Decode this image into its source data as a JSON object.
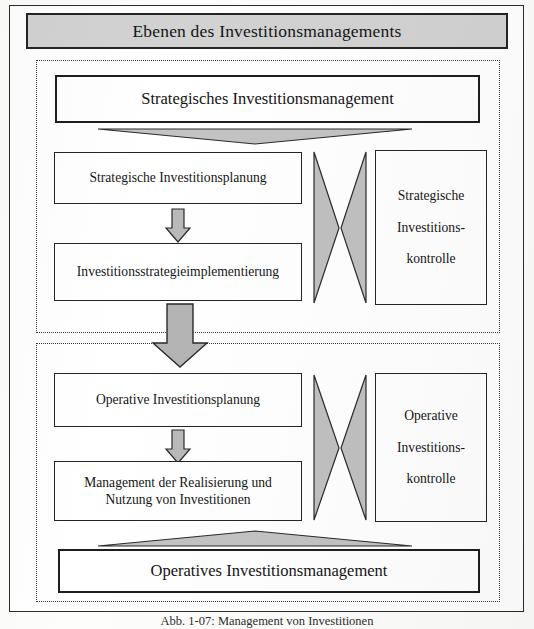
{
  "figure": {
    "title": "Ebenen des Investitionsmanagements",
    "caption": "Abb. 1-07:  Management von Investitionen"
  },
  "colors": {
    "banner_fill": "#d2d2d2",
    "arrow_fill": "#b9b9b9",
    "border_dark": "#1e1e1e",
    "page_background": "#ffffff"
  },
  "sections": {
    "strategic": {
      "level_box": "Strategisches Investitionsmanagement",
      "planning_box": "Strategische Investitionsplanung",
      "implementation_box": "Investitionsstrategieimplementierung",
      "control_box": {
        "line1": "Strategische",
        "line2": "Investitions-",
        "line3": "kontrolle"
      }
    },
    "operative": {
      "level_box": "Operatives Investitionsmanagement",
      "planning_box": "Operative Investitionsplanung",
      "realization_box_line1": "Management der Realisierung und",
      "realization_box_line2": "Nutzung von Investitionen",
      "control_box": {
        "line1": "Operative",
        "line2": "Investitions-",
        "line3": "kontrolle"
      }
    }
  },
  "connectors": {
    "triangle_down_label": "flat-triangle-down",
    "triangle_up_label": "flat-triangle-up",
    "bowtie_strategic_label": "bowtie-double-arrow-strategic",
    "bowtie_operative_label": "bowtie-double-arrow-operative",
    "small_arrow_strategic_label": "down-arrow-planning-to-implementation",
    "small_arrow_operative_label": "down-arrow-planning-to-realization",
    "big_arrow_label": "down-arrow-strategic-to-operative"
  }
}
